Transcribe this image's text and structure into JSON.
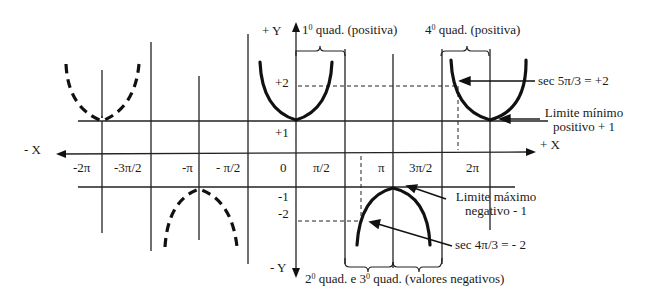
{
  "axes": {
    "pos_y": "+ Y",
    "neg_y": "- Y",
    "pos_x": "+ X",
    "neg_x": "- X"
  },
  "x_ticks": [
    "-2π",
    "-3π/2",
    "-π",
    "- π/2",
    "0",
    "π/2",
    "π",
    "3π/2",
    "2π"
  ],
  "y_ticks": {
    "p2": "+2",
    "p1": "+1",
    "n1": "-1",
    "n2": "-2"
  },
  "annotations": {
    "q1_num": "1",
    "q1_text": " quad. (positiva)",
    "q4_num": "4",
    "q4_text": " quad. (positiva)",
    "sup": "0",
    "sec53": "sec 5π/3 = +2",
    "lim_min_1": "Limite mínimo",
    "lim_min_2": "positivo + 1",
    "lim_max_1": "Limite máximo",
    "lim_max_2": "negativo - 1",
    "sec43": "sec 4π/3 = - 2",
    "q23_a": "2",
    "q23_b": " quad. e 3",
    "q23_c": " quad. (valores negativos)"
  }
}
